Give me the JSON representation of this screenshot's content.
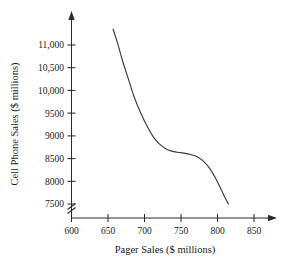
{
  "chart_data": {
    "type": "line",
    "title": "",
    "xlabel": "Pager Sales ($ millions)",
    "ylabel": "Cell Phone Sales ($ millions)",
    "xlim": [
      600,
      860
    ],
    "ylim": [
      7400,
      11400
    ],
    "grid": false,
    "legend": null,
    "axis_break": {
      "axis": "y",
      "between": [
        7400,
        7500
      ],
      "style": "zigzag"
    },
    "xticks": [
      600,
      650,
      700,
      750,
      800,
      850
    ],
    "xtick_labels": [
      "600",
      "650",
      "700",
      "750",
      "800",
      "850"
    ],
    "yticks": [
      7500,
      8000,
      8500,
      9000,
      9500,
      10000,
      10500,
      11000
    ],
    "ytick_labels": [
      "7500",
      "8000",
      "8500",
      "9000",
      "9500",
      "10,000",
      "10,500",
      "11,000"
    ],
    "series": [
      {
        "name": "Cell Phone Sales vs Pager Sales",
        "x": [
          657,
          663,
          670,
          678,
          686,
          695,
          704,
          712,
          720,
          728,
          736,
          745,
          754,
          763,
          772,
          781,
          789,
          797,
          805,
          811,
          815
        ],
        "values": [
          11350,
          11050,
          10650,
          10250,
          9850,
          9500,
          9200,
          8980,
          8830,
          8730,
          8670,
          8640,
          8620,
          8590,
          8540,
          8440,
          8290,
          8080,
          7820,
          7620,
          7500
        ]
      }
    ]
  }
}
